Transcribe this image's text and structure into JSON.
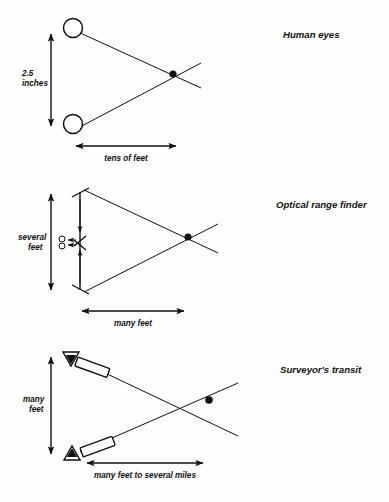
{
  "figure": {
    "title_visible": false,
    "background_color": "#fefefe",
    "ink_color": "#111111",
    "panels": [
      {
        "id": "human-eyes",
        "caption": "Human eyes",
        "baseline_label_line1": "2.5",
        "baseline_label_line2": "inches",
        "distance_label": "tens of feet",
        "sensor_type": "eye-circles",
        "sensor_count": 2
      },
      {
        "id": "optical-range-finder",
        "caption": "Optical range finder",
        "baseline_label_line1": "several",
        "baseline_label_line2": "feet",
        "distance_label": "many feet",
        "sensor_type": "rangefinder-body-with-eyepiece",
        "sensor_count": 1
      },
      {
        "id": "surveyors-transit",
        "caption": "Surveyor's transit",
        "baseline_label_line1": "many",
        "baseline_label_line2": "feet",
        "distance_label": "many feet to several miles",
        "sensor_type": "transit-tripod-telescope",
        "sensor_count": 2
      }
    ]
  }
}
